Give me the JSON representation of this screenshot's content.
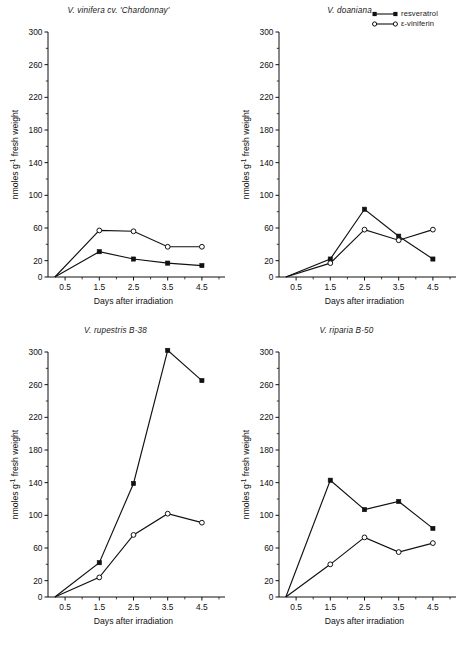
{
  "figure": {
    "legend": {
      "items": [
        {
          "label": "resveratrol",
          "marker": "filled-square",
          "icon": "filled-square-line-icon"
        },
        {
          "label": "ε-viniferin",
          "marker": "open-circle",
          "icon": "open-circle-line-icon"
        }
      ]
    },
    "caption_fragment": ""
  },
  "chart_data": [
    {
      "type": "line",
      "title": "V. vinifera cv. 'Chardonnay'",
      "xlabel": "Days after irradiation",
      "ylabel": "nmoles g⁻¹ fresh weight",
      "x": [
        0.2,
        1.5,
        2.5,
        3.5,
        4.5
      ],
      "xticks": [
        0.5,
        1.5,
        2.5,
        3.5,
        4.5
      ],
      "xticklabels": [
        "0.5",
        "1.5",
        "2.5",
        "3.5",
        "4.5"
      ],
      "xlim": [
        0.0,
        5.0
      ],
      "yticks": [
        0,
        20,
        60,
        100,
        140,
        180,
        220,
        260,
        300
      ],
      "yticklabels": [
        "0",
        "20",
        "60",
        "100",
        "140",
        "180",
        "220",
        "260",
        "300"
      ],
      "ylim": [
        0,
        300
      ],
      "grid": false,
      "series": [
        {
          "name": "resveratrol",
          "marker": "filled-square",
          "values": [
            0,
            31,
            22,
            17,
            14
          ]
        },
        {
          "name": "ε-viniferin",
          "marker": "open-circle",
          "values": [
            0,
            57,
            56,
            37,
            37
          ]
        }
      ]
    },
    {
      "type": "line",
      "title": "V. doaniana",
      "xlabel": "Days after irradiation",
      "ylabel": "nmoles g⁻¹ fresh weight",
      "x": [
        0.2,
        1.5,
        2.5,
        3.5,
        4.5
      ],
      "xticks": [
        0.5,
        1.5,
        2.5,
        3.5,
        4.5
      ],
      "xticklabels": [
        "0.5",
        "1.5",
        "2.5",
        "3.5",
        "4.5"
      ],
      "xlim": [
        0.0,
        5.0
      ],
      "yticks": [
        0,
        20,
        60,
        100,
        140,
        180,
        220,
        260,
        300
      ],
      "yticklabels": [
        "0",
        "20",
        "60",
        "100",
        "140",
        "180",
        "220",
        "260",
        "300"
      ],
      "ylim": [
        0,
        300
      ],
      "grid": false,
      "series": [
        {
          "name": "resveratrol",
          "marker": "filled-square",
          "values": [
            0,
            22,
            83,
            50,
            22
          ]
        },
        {
          "name": "ε-viniferin",
          "marker": "open-circle",
          "values": [
            0,
            17,
            58,
            45,
            58
          ]
        }
      ]
    },
    {
      "type": "line",
      "title": "V. rupestris B-38",
      "xlabel": "Days after irradiation",
      "ylabel": "nmoles g⁻¹ fresh weight",
      "x": [
        0.2,
        1.5,
        2.5,
        3.5,
        4.5
      ],
      "xticks": [
        0.5,
        1.5,
        2.5,
        3.5,
        4.5
      ],
      "xticklabels": [
        "0.5",
        "1.5",
        "2.5",
        "3.5",
        "4.5"
      ],
      "xlim": [
        0.0,
        5.0
      ],
      "yticks": [
        0,
        20,
        60,
        100,
        140,
        180,
        220,
        260,
        300
      ],
      "yticklabels": [
        "0",
        "20",
        "60",
        "100",
        "140",
        "180",
        "220",
        "260",
        "300"
      ],
      "ylim": [
        0,
        300
      ],
      "grid": false,
      "series": [
        {
          "name": "resveratrol",
          "marker": "filled-square",
          "values": [
            0,
            42,
            139,
            302,
            265
          ]
        },
        {
          "name": "ε-viniferin",
          "marker": "open-circle",
          "values": [
            0,
            24,
            76,
            102,
            91
          ]
        }
      ]
    },
    {
      "type": "line",
      "title": "V. riparia B-50",
      "xlabel": "Days after irradiation",
      "ylabel": "nmoles g⁻¹ fresh weight",
      "x": [
        0.2,
        1.5,
        2.5,
        3.5,
        4.5
      ],
      "xticks": [
        0.5,
        1.5,
        2.5,
        3.5,
        4.5
      ],
      "xticklabels": [
        "0.5",
        "1.5",
        "2.5",
        "3.5",
        "4.5"
      ],
      "xlim": [
        0.0,
        5.0
      ],
      "yticks": [
        0,
        20,
        60,
        100,
        140,
        180,
        220,
        260,
        300
      ],
      "yticklabels": [
        "0",
        "20",
        "60",
        "100",
        "140",
        "180",
        "220",
        "260",
        "300"
      ],
      "ylim": [
        0,
        300
      ],
      "grid": false,
      "series": [
        {
          "name": "resveratrol",
          "marker": "filled-square",
          "values": [
            0,
            143,
            107,
            117,
            84
          ]
        },
        {
          "name": "ε-viniferin",
          "marker": "open-circle",
          "values": [
            0,
            40,
            73,
            55,
            66
          ]
        }
      ]
    }
  ]
}
